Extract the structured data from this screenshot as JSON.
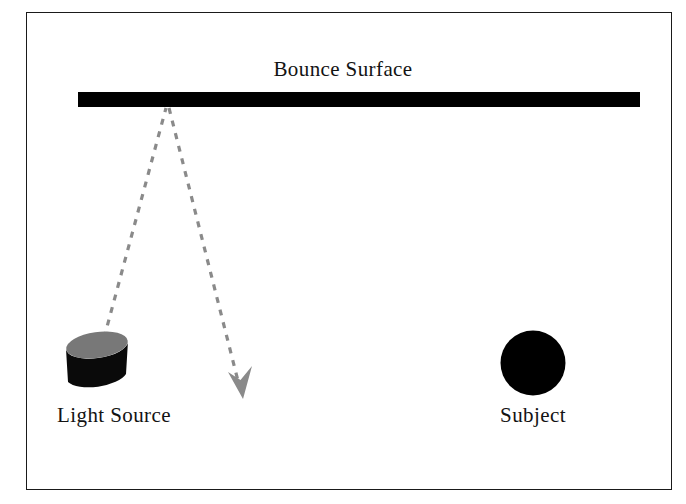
{
  "diagram": {
    "type": "lighting-setup-diagram",
    "title": "Bounce Surface",
    "background_color": "#ffffff",
    "frame": {
      "border_color": "#1a1a1a",
      "x": 26,
      "y": 12,
      "width": 646,
      "height": 478
    },
    "elements": {
      "bounce_surface": {
        "label": "Bounce Surface",
        "shape": "bar",
        "color": "#000000",
        "x": 78,
        "y": 92,
        "width": 562,
        "height": 15
      },
      "light_source": {
        "label": "Light Source",
        "shape": "cylinder",
        "body_color": "#0a0a0a",
        "top_color": "#787878",
        "x": 66,
        "y": 334,
        "width": 62,
        "height": 58
      },
      "subject": {
        "label": "Subject",
        "shape": "circle",
        "color": "#000000",
        "center_x": 533,
        "center_y": 363,
        "radius": 32
      }
    },
    "light_path": {
      "stroke_color": "#8a8a8a",
      "stroke_width": 3,
      "dash_pattern": "6 7",
      "incident_ray": {
        "from_x": 104,
        "from_y": 338,
        "to_x": 166,
        "to_y": 108,
        "description": "light-source-to-bounce-surface"
      },
      "reflected_ray": {
        "from_x": 169,
        "from_y": 108,
        "to_x": 240,
        "to_y": 386,
        "description": "bounce-surface-to-subject"
      },
      "arrowhead": {
        "tip_x": 243,
        "tip_y": 399,
        "color": "#8a8a8a",
        "direction": "down-right"
      }
    }
  }
}
